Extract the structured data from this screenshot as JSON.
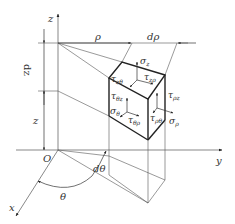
{
  "diagram": {
    "type": "cylindrical-coordinate stress element",
    "axes": {
      "z": "z",
      "y": "y",
      "x": "x",
      "origin": "O"
    },
    "dimensions": {
      "rho": "ρ",
      "d_rho": "dρ",
      "dz": "dz",
      "z": "z",
      "theta": "θ",
      "d_theta": "dθ"
    },
    "stresses": {
      "sigma_z": "σ",
      "sigma_z_sub": "z",
      "tau_z_theta": "τ",
      "tau_z_theta_sub": "zθ",
      "tau_z_rho": "τ",
      "tau_z_rho_sub": "zρ",
      "tau_theta_z": "τ",
      "tau_theta_z_sub": "θz",
      "tau_rho_z": "τ",
      "tau_rho_z_sub": "ρz",
      "sigma_theta": "σ",
      "sigma_theta_sub": "θ",
      "tau_theta_rho": "τ",
      "tau_theta_rho_sub": "θρ",
      "tau_rho_theta": "τ",
      "tau_rho_theta_sub": "ρθ",
      "sigma_rho": "σ",
      "sigma_rho_sub": "ρ"
    }
  }
}
